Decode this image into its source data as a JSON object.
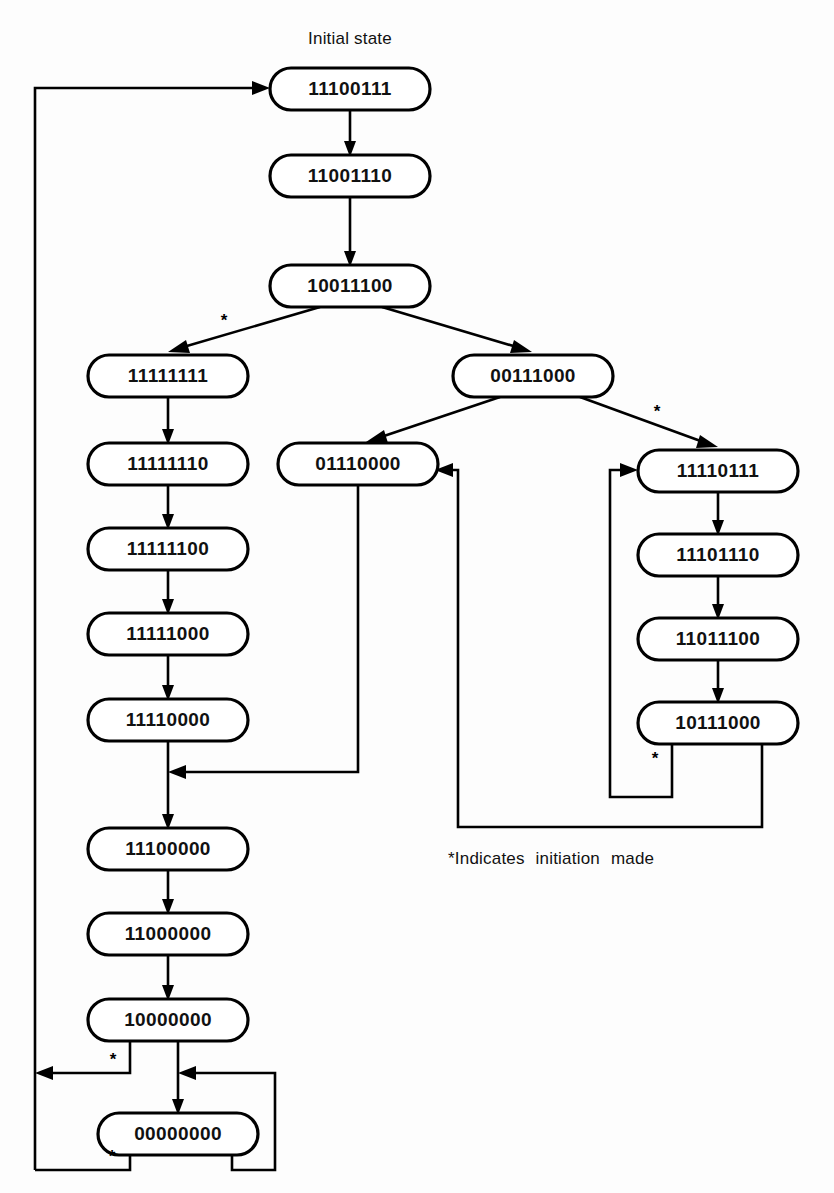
{
  "figure": {
    "kind": "state-transition-diagram",
    "initial_state_label": "Initial state",
    "footnote": "*Indicates  initiation  made",
    "asterisk_glyph": "*",
    "background_color": "#fdfdfd",
    "line_color": "#000000",
    "node_fill_color": "#ffffff",
    "text_color": "#111111"
  },
  "nodes": [
    {
      "id": "n0",
      "label": "11100111",
      "x": 270,
      "y": 68,
      "w": 160,
      "h": 42
    },
    {
      "id": "n1",
      "label": "11001110",
      "x": 270,
      "y": 155,
      "w": 160,
      "h": 42
    },
    {
      "id": "n2",
      "label": "10011100",
      "x": 270,
      "y": 265,
      "w": 160,
      "h": 42
    },
    {
      "id": "n3",
      "label": "11111111",
      "x": 88,
      "y": 355,
      "w": 160,
      "h": 42
    },
    {
      "id": "n4",
      "label": "00111000",
      "x": 453,
      "y": 355,
      "w": 160,
      "h": 42
    },
    {
      "id": "n5",
      "label": "11111110",
      "x": 88,
      "y": 443,
      "w": 160,
      "h": 42
    },
    {
      "id": "n6",
      "label": "01110000",
      "x": 278,
      "y": 443,
      "w": 160,
      "h": 42
    },
    {
      "id": "n7",
      "label": "11110111",
      "x": 638,
      "y": 450,
      "w": 160,
      "h": 42
    },
    {
      "id": "n8",
      "label": "11111100",
      "x": 88,
      "y": 528,
      "w": 160,
      "h": 42
    },
    {
      "id": "n9",
      "label": "11101110",
      "x": 638,
      "y": 534,
      "w": 160,
      "h": 42
    },
    {
      "id": "n10",
      "label": "11111000",
      "x": 88,
      "y": 613,
      "w": 160,
      "h": 42
    },
    {
      "id": "n11",
      "label": "11011100",
      "x": 638,
      "y": 618,
      "w": 160,
      "h": 42
    },
    {
      "id": "n12",
      "label": "11110000",
      "x": 88,
      "y": 699,
      "w": 160,
      "h": 42
    },
    {
      "id": "n13",
      "label": "10111000",
      "x": 638,
      "y": 702,
      "w": 160,
      "h": 42
    },
    {
      "id": "n14",
      "label": "11100000",
      "x": 88,
      "y": 828,
      "w": 160,
      "h": 42
    },
    {
      "id": "n15",
      "label": "11000000",
      "x": 88,
      "y": 913,
      "w": 160,
      "h": 42
    },
    {
      "id": "n16",
      "label": "10000000",
      "x": 88,
      "y": 999,
      "w": 160,
      "h": 42
    },
    {
      "id": "n17",
      "label": "00000000",
      "x": 98,
      "y": 1113,
      "w": 160,
      "h": 42
    }
  ],
  "edges": [
    {
      "from": "n0",
      "to": "n1",
      "marked": false
    },
    {
      "from": "n1",
      "to": "n2",
      "marked": false
    },
    {
      "from": "n2",
      "to": "n3",
      "marked": true
    },
    {
      "from": "n2",
      "to": "n4",
      "marked": false
    },
    {
      "from": "n3",
      "to": "n5",
      "marked": false
    },
    {
      "from": "n4",
      "to": "n6",
      "marked": false
    },
    {
      "from": "n4",
      "to": "n7",
      "marked": true
    },
    {
      "from": "n5",
      "to": "n8",
      "marked": false
    },
    {
      "from": "n8",
      "to": "n10",
      "marked": false
    },
    {
      "from": "n10",
      "to": "n12",
      "marked": false
    },
    {
      "from": "n12",
      "to": "n14",
      "marked": false
    },
    {
      "from": "n14",
      "to": "n15",
      "marked": false
    },
    {
      "from": "n15",
      "to": "n16",
      "marked": false
    },
    {
      "from": "n16",
      "to": "n17",
      "marked": false
    },
    {
      "from": "n16",
      "to": "n0",
      "marked": true
    },
    {
      "from": "n17",
      "to": "n0",
      "marked": true
    },
    {
      "from": "n17",
      "to": "n17",
      "marked": false
    },
    {
      "from": "n6",
      "to": "n14",
      "marked": false
    },
    {
      "from": "n7",
      "to": "n9",
      "marked": false
    },
    {
      "from": "n9",
      "to": "n11",
      "marked": false
    },
    {
      "from": "n11",
      "to": "n13",
      "marked": false
    },
    {
      "from": "n13",
      "to": "n7",
      "marked": true
    },
    {
      "from": "n13",
      "to": "n6",
      "marked": false
    }
  ],
  "asterisks": [
    {
      "id": "a1",
      "x": 224,
      "y": 322
    },
    {
      "id": "a2",
      "x": 657,
      "y": 413
    },
    {
      "id": "a3",
      "x": 655,
      "y": 760
    },
    {
      "id": "a4",
      "x": 113,
      "y": 1061
    },
    {
      "id": "a5",
      "x": 112,
      "y": 1158
    }
  ],
  "labels": {
    "initial_state": {
      "x": 350,
      "y": 44
    },
    "footnote": {
      "x": 448,
      "y": 864
    }
  }
}
